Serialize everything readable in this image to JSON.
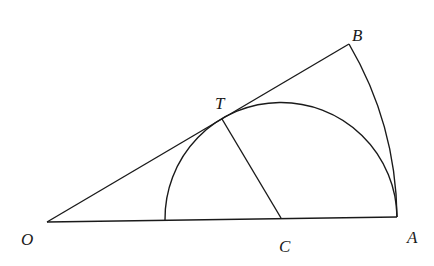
{
  "diagram": {
    "type": "geometry",
    "points": {
      "O": {
        "label": "O",
        "x": 47,
        "y": 222
      },
      "A": {
        "label": "A",
        "x": 397,
        "y": 217
      },
      "B": {
        "label": "B",
        "x": 349,
        "y": 44
      },
      "T": {
        "label": "T",
        "x": 222,
        "y": 119
      },
      "C": {
        "label": "C",
        "x": 281,
        "y": 218
      }
    },
    "labels": {
      "O": "O",
      "A": "A",
      "B": "B",
      "T": "T",
      "C": "C"
    },
    "segments": [
      "OA",
      "OB",
      "CT"
    ],
    "arcs": [
      {
        "name": "arc-AB",
        "center": "O",
        "from": "A",
        "to": "B"
      },
      {
        "name": "semicircle",
        "center": "C",
        "radius_to": "A",
        "tangent_at": "T"
      }
    ]
  }
}
